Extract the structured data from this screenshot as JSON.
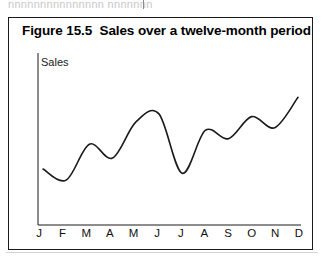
{
  "scan": {
    "top_artifact_text": "nnnnnnnnnnnnnnn nnnnnnn",
    "bottom_rule": ""
  },
  "figure": {
    "number": "Figure 15.5",
    "title": "Figure 15.5  Sales over a twelve-month period",
    "caption_text": "Sales over a twelve-month period"
  },
  "chart_data": {
    "type": "line",
    "title": "Figure 15.5  Sales over a twelve-month period",
    "xlabel": "",
    "ylabel": "Sales",
    "categories": [
      "J",
      "F",
      "M",
      "A",
      "M",
      "J",
      "J",
      "A",
      "S",
      "O",
      "N",
      "D"
    ],
    "category_names": [
      "January",
      "February",
      "March",
      "April",
      "May",
      "June",
      "July",
      "August",
      "September",
      "October",
      "November",
      "December"
    ],
    "values": [
      34,
      26,
      52,
      42,
      68,
      74,
      31,
      62,
      56,
      72,
      64,
      86
    ],
    "ylim": [
      0,
      100
    ],
    "xlim": [
      0,
      11
    ],
    "grid": false,
    "legend": false,
    "axis_tick_marks": false,
    "y_axis_numeric_labels": false,
    "line_color": "#1a1a1a",
    "line_width_px": 1.6,
    "smoothing": "spline",
    "note": "Y axis is unlabeled/unscaled; values are relative units read off the curve height."
  },
  "axes": {
    "y_label": "Sales",
    "x_labels": [
      "J",
      "F",
      "M",
      "A",
      "M",
      "J",
      "J",
      "A",
      "S",
      "O",
      "N",
      "D"
    ],
    "axis_color": "#1a1a1a"
  },
  "colors": {
    "background": "#ffffff",
    "border": "#1a1a1a",
    "text": "#111111",
    "line": "#1a1a1a",
    "faint_rule": "#d4d4d4"
  }
}
